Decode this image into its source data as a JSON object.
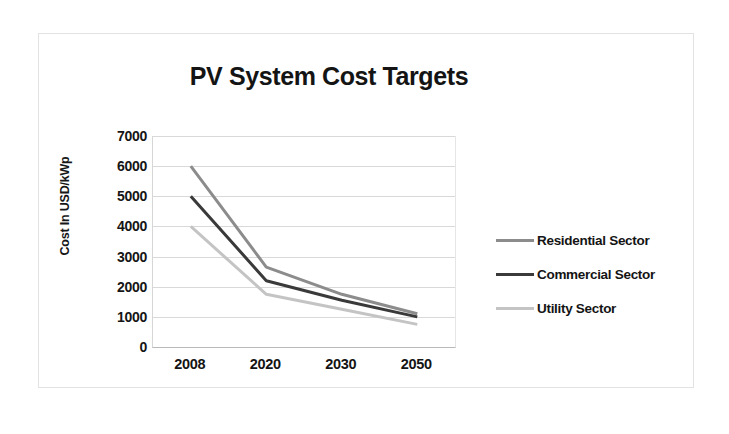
{
  "chart_data": {
    "type": "line",
    "title": "PV System Cost Targets",
    "xlabel": "",
    "ylabel": "Cost In USD/kWp",
    "categories": [
      "2008",
      "2020",
      "2030",
      "2050"
    ],
    "ylim": [
      0,
      7000
    ],
    "y_ticks": [
      "7000",
      "6000",
      "5000",
      "4000",
      "3000",
      "2000",
      "1000",
      "0"
    ],
    "y_tick_values": [
      7000,
      6000,
      5000,
      4000,
      3000,
      2000,
      1000,
      0
    ],
    "grid": true,
    "legend_position": "right",
    "series": [
      {
        "name": "Residential Sector",
        "values": [
          6000,
          2650,
          1750,
          1100
        ],
        "color": "#8c8c8c"
      },
      {
        "name": "Commercial Sector",
        "values": [
          5000,
          2200,
          1550,
          1000
        ],
        "color": "#3a3a3a"
      },
      {
        "name": "Utility Sector",
        "values": [
          4000,
          1750,
          1250,
          750
        ],
        "color": "#c4c4c4"
      }
    ]
  },
  "colors": {
    "frame_border": "#e2e2e2",
    "gridline": "#d9d9d9",
    "text": "#141414",
    "background": "#ffffff"
  }
}
